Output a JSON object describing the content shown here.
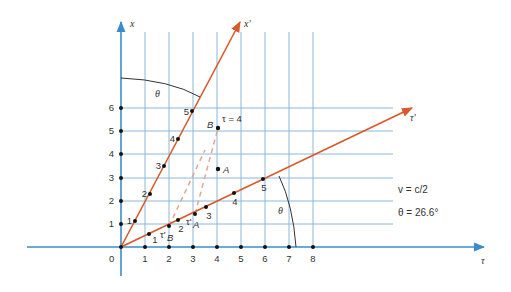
{
  "diagram": {
    "type": "spacetime-diagram",
    "axes": {
      "tau_label": "τ",
      "x_label": "x",
      "tau_prime_label": "τ'",
      "x_prime_label": "x'",
      "origin_label": "0",
      "tau_ticks": [
        "1",
        "2",
        "3",
        "4",
        "5",
        "6",
        "7",
        "8"
      ],
      "x_ticks": [
        "1",
        "2",
        "3",
        "4",
        "5",
        "6"
      ]
    },
    "x_prime_ticks": [
      "1",
      "2",
      "3",
      "4",
      "5"
    ],
    "tau_prime_ticks": [
      "1",
      "2",
      "3",
      "4",
      "5"
    ],
    "events": {
      "A": "A",
      "B": "B",
      "B_annotation": "τ = 4"
    },
    "projections": {
      "tau_prime_A": "τ'",
      "tau_prime_A_sub": "A",
      "tau_prime_B": "τ'",
      "tau_prime_B_sub": "B"
    },
    "angle_label": "θ",
    "notes": {
      "velocity": "v = c/2",
      "angle": "θ = 26.6°"
    },
    "colors": {
      "grid": "#8ab8de",
      "axis": "#3a8ccc",
      "primed_axis": "#d85a2a",
      "dashed": "#e0a890",
      "dot": "#111111",
      "arc": "#333333"
    }
  }
}
